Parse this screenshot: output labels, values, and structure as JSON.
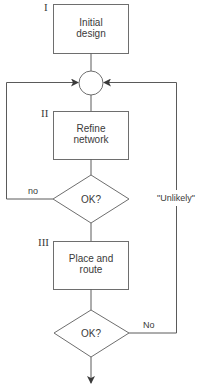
{
  "diagram": {
    "type": "flowchart",
    "steps": [
      {
        "numeral": "I",
        "line1": "Initial",
        "line2": "design"
      },
      {
        "numeral": "II",
        "line1": "Refine",
        "line2": "network"
      },
      {
        "numeral": "III",
        "line1": "Place and",
        "line2": "route"
      }
    ],
    "decisions": [
      {
        "label": "OK?",
        "branch_label": "no"
      },
      {
        "label": "OK?",
        "branch_label": "No"
      }
    ],
    "feedback_label": "\"Unlikely\""
  }
}
